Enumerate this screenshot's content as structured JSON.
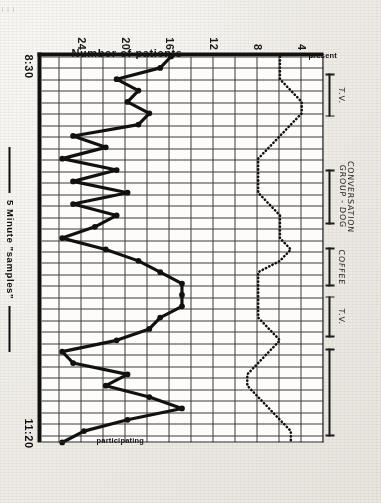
{
  "figure": {
    "kind": "line-chart",
    "medium": "photocopied graph paper, handwritten annotations",
    "orientation_note": "rotated 90 degrees"
  },
  "axes": {
    "y_title": "Number of patients",
    "y_ticks": [
      "24",
      "20",
      "16",
      "12",
      "8",
      "4"
    ],
    "y_min": 0,
    "y_max": 26,
    "x_title": "5 Minute \"samples\"",
    "x_start_label": "8:30",
    "x_end_label": "11:20"
  },
  "series_labels": {
    "present": "present",
    "participating": "participating"
  },
  "annotations": [
    {
      "id": "tv-1",
      "label": "T.V.",
      "start": 0.055,
      "end": 0.165,
      "bare": false
    },
    {
      "id": "conv-group",
      "label": "CONVERSATION\nGROUP - DOG",
      "start": 0.3,
      "end": 0.44,
      "bare": false
    },
    {
      "id": "coffee",
      "label": "COFFEE",
      "start": 0.5,
      "end": 0.6,
      "bare": false
    },
    {
      "id": "tv-2",
      "label": "T.V.",
      "start": 0.625,
      "end": 0.73,
      "bare": false
    },
    {
      "id": "tv-3",
      "label": "",
      "start": 0.76,
      "end": 0.985,
      "bare": true
    }
  ],
  "corner_artifact": "|  |  |",
  "colors": {
    "ink": "#111111",
    "grid": "#3b3b3b",
    "paper": "#fdfcfa",
    "sheet": "#efece6"
  },
  "chart_data": {
    "type": "line",
    "title": "",
    "xlabel": "5 Minute \"samples\"",
    "ylabel": "Number of patients",
    "xlim": [
      0,
      34
    ],
    "ylim": [
      0,
      26
    ],
    "grid": true,
    "legend": "in-plot end labels",
    "x_tick_labels": [
      "8:30",
      "11:20"
    ],
    "y_tick_values": [
      4,
      8,
      12,
      16,
      20,
      24
    ],
    "x": [
      0,
      1,
      2,
      3,
      4,
      5,
      6,
      7,
      8,
      9,
      10,
      11,
      12,
      13,
      14,
      15,
      16,
      17,
      18,
      19,
      20,
      21,
      22,
      23,
      24,
      25,
      26,
      27,
      28,
      29,
      30,
      31,
      32,
      33,
      34
    ],
    "series": [
      {
        "name": "present",
        "style": "dotted",
        "values": [
          22,
          22,
          22,
          23,
          24,
          24,
          23,
          22,
          21,
          20,
          20,
          20,
          20,
          21,
          22,
          22,
          22,
          23,
          22,
          20,
          20,
          20,
          20,
          20,
          21,
          22,
          21,
          20,
          19,
          19,
          20,
          21,
          22,
          23,
          23
        ]
      },
      {
        "name": "participating",
        "style": "solid-with-markers",
        "values": [
          12,
          11,
          7,
          9,
          8,
          10,
          9,
          3,
          6,
          2,
          7,
          3,
          8,
          3,
          7,
          5,
          2,
          6,
          9,
          11,
          13,
          13,
          13,
          11,
          10,
          7,
          2,
          3,
          8,
          6,
          10,
          13,
          8,
          4,
          2
        ]
      }
    ]
  }
}
